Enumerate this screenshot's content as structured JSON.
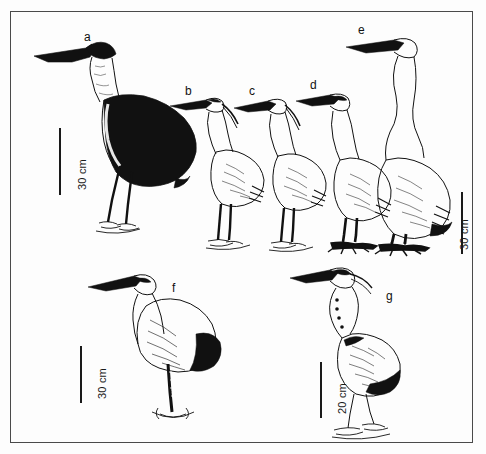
{
  "figure": {
    "kind": "scientific-illustration",
    "background_color": "#fdfdfd",
    "ink_color": "#111111",
    "frame_color": "#4a4a4a",
    "panel_count": 7
  },
  "labels": [
    {
      "id": "a",
      "text": "a"
    },
    {
      "id": "b",
      "text": "b"
    },
    {
      "id": "c",
      "text": "c"
    },
    {
      "id": "d",
      "text": "d"
    },
    {
      "id": "e",
      "text": "e"
    },
    {
      "id": "f",
      "text": "f"
    },
    {
      "id": "g",
      "text": "g"
    }
  ],
  "scale_bars": [
    {
      "id": "scale-a",
      "text": "30 cm",
      "value": 30,
      "unit": "cm"
    },
    {
      "id": "scale-bcde",
      "text": "30 cm",
      "value": 30,
      "unit": "cm"
    },
    {
      "id": "scale-f",
      "text": "30 cm",
      "value": 30,
      "unit": "cm"
    },
    {
      "id": "scale-g",
      "text": "20 cm",
      "value": 20,
      "unit": "cm"
    }
  ]
}
